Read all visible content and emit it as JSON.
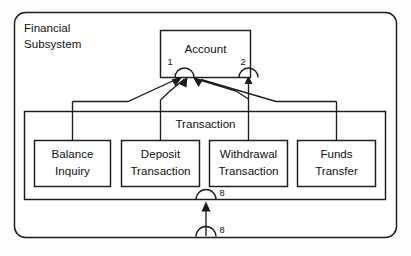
{
  "diagram": {
    "type": "uml-subsystem-diagram",
    "background_color": "#fdfdfd",
    "line_color": "#1b1b1b",
    "fill_color": "#ffffff",
    "subsystem": {
      "name_line_1": "Financial",
      "name_line_2": "Subsystem"
    },
    "account_class": {
      "label": "Account"
    },
    "transaction_container": {
      "label": "Transaction"
    },
    "operations": [
      {
        "line_1": "Balance",
        "line_2": "Inquiry"
      },
      {
        "line_1": "Deposit",
        "line_2": "Transaction"
      },
      {
        "line_1": "Withdrawal",
        "line_2": "Transaction"
      },
      {
        "line_1": "Funds",
        "line_2": "Transfer"
      }
    ],
    "port_labels": {
      "account_port_1": "1",
      "account_port_2": "2",
      "transaction_port": "8",
      "subsystem_port": "8"
    },
    "icons": {
      "provided_interface": "semicircle-socket-icon",
      "dependency_arrow": "filled-arrowhead-icon"
    }
  }
}
